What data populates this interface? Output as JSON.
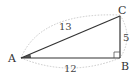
{
  "figure": {
    "type": "right-triangle",
    "vertices": {
      "A": {
        "label": "A"
      },
      "B": {
        "label": "B"
      },
      "C": {
        "label": "C"
      }
    },
    "right_angle_at": "B",
    "marked_angle": "A",
    "sides": {
      "AC": {
        "label": "13"
      },
      "AB": {
        "label": "12"
      },
      "BC": {
        "label": "5"
      }
    },
    "colors": {
      "line": "#333333",
      "arc": "#bbbbbb",
      "angle_fill": "#555555"
    }
  }
}
